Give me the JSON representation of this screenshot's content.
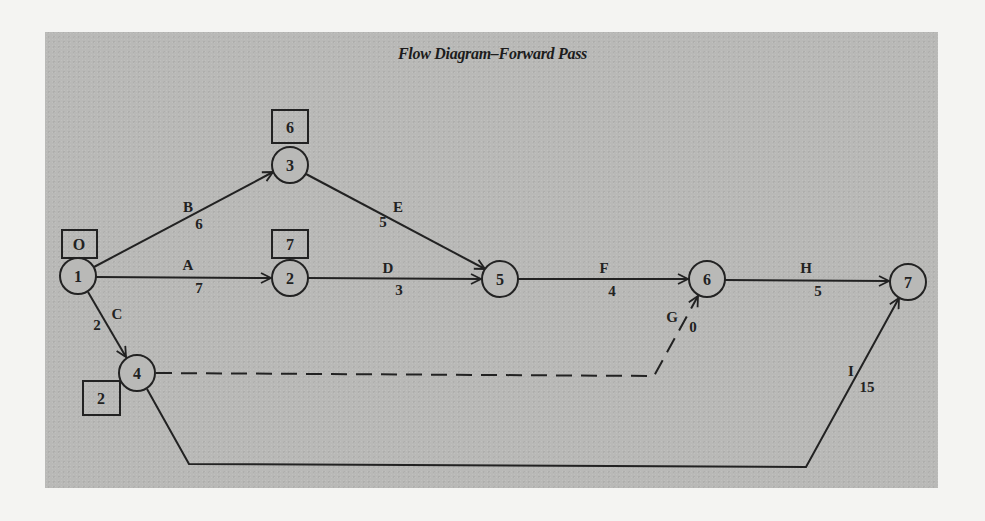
{
  "title": "Flow Diagram–Forward Pass",
  "colors": {
    "page_background": "#f4f4f2",
    "panel_background": "#b9b9b7",
    "ink": "#222222"
  },
  "nodes": [
    {
      "id": "1",
      "label": "1",
      "earliest_time": "O"
    },
    {
      "id": "2",
      "label": "2",
      "earliest_time": "7"
    },
    {
      "id": "3",
      "label": "3",
      "earliest_time": "6"
    },
    {
      "id": "4",
      "label": "4",
      "earliest_time": "2"
    },
    {
      "id": "5",
      "label": "5"
    },
    {
      "id": "6",
      "label": "6"
    },
    {
      "id": "7",
      "label": "7"
    }
  ],
  "activities": [
    {
      "name": "A",
      "duration": "7",
      "from": "1",
      "to": "2",
      "style": "solid"
    },
    {
      "name": "B",
      "duration": "6",
      "from": "1",
      "to": "3",
      "style": "solid"
    },
    {
      "name": "C",
      "duration": "2",
      "from": "1",
      "to": "4",
      "style": "solid"
    },
    {
      "name": "D",
      "duration": "3",
      "from": "2",
      "to": "5",
      "style": "solid"
    },
    {
      "name": "E",
      "duration": "5",
      "from": "3",
      "to": "5",
      "style": "solid"
    },
    {
      "name": "F",
      "duration": "4",
      "from": "5",
      "to": "6",
      "style": "solid"
    },
    {
      "name": "G",
      "duration": "0",
      "from": "4",
      "to": "6",
      "style": "dashed"
    },
    {
      "name": "H",
      "duration": "5",
      "from": "6",
      "to": "7",
      "style": "solid"
    },
    {
      "name": "I",
      "duration": "15",
      "from": "4",
      "to": "7",
      "style": "solid"
    }
  ]
}
